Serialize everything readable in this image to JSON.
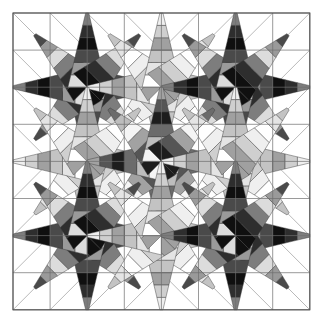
{
  "figure": {
    "kind": "quilt-block-diagram",
    "background_color": "#ffffff",
    "width": 324,
    "height": 331
  },
  "canvas": {
    "origin_x": 13,
    "origin_y": 13,
    "cell_size": 37.1,
    "cols": 8,
    "rows": 8,
    "frame_color": "#555555",
    "grid_color": "#6e6e6e",
    "patch_outline_color": "#3a3a3a"
  },
  "palette": {
    "white": "#ffffff",
    "near_white": "#f2f2f2",
    "light_gray": "#cfcfcf",
    "mid_light_gray": "#a8a8a8",
    "mid_gray": "#888888",
    "dark_gray": "#4f4f4f",
    "near_black": "#1a1a1a",
    "black": "#0d0d0d"
  },
  "ramps": {
    "light_ramp": [
      "#ffffff",
      "#e4e4e4",
      "#c3c3c3",
      "#a0a0a0",
      "#cfcfcf",
      "#efefef"
    ],
    "dark_ramp": [
      "#dcdcdc",
      "#9a9a9a",
      "#4a4a4a",
      "#101010",
      "#2e2e2e",
      "#7d7d7d"
    ],
    "mixed_ramp": [
      "#f5f5f5",
      "#bdbdbd",
      "#6b6b6b",
      "#1d1d1d",
      "#555555",
      "#a2a2a2"
    ]
  },
  "stars": [
    {
      "name": "star-top-left",
      "cx": 2,
      "cy": 2,
      "ramp": "dark_ramp"
    },
    {
      "name": "star-top-center",
      "cx": 4,
      "cy": 2,
      "ramp": "light_ramp"
    },
    {
      "name": "star-top-right",
      "cx": 6,
      "cy": 2,
      "ramp": "dark_ramp"
    },
    {
      "name": "star-middle-left",
      "cx": 2,
      "cy": 4,
      "ramp": "light_ramp"
    },
    {
      "name": "star-center",
      "cx": 4,
      "cy": 4,
      "ramp": "mixed_ramp"
    },
    {
      "name": "star-middle-right",
      "cx": 6,
      "cy": 4,
      "ramp": "light_ramp"
    },
    {
      "name": "star-bottom-left",
      "cx": 2,
      "cy": 6,
      "ramp": "dark_ramp"
    },
    {
      "name": "star-bottom-center",
      "cx": 4,
      "cy": 6,
      "ramp": "light_ramp"
    },
    {
      "name": "star-bottom-right",
      "cx": 6,
      "cy": 6,
      "ramp": "dark_ramp"
    }
  ],
  "star_geometry": {
    "points": 8,
    "bands_per_arm": 6,
    "arm_reach_cells": 2,
    "half_width_cells": 0.52,
    "description": "Each star has eight striped arms radiating from a grid intersection; arms alternate between cardinal (longer, chevron tipped) and diagonal directions."
  },
  "chart_data": {
    "type": "heatmap",
    "grid": {
      "cols": 8,
      "rows": 8
    },
    "legend_position": "none",
    "annotations": []
  }
}
